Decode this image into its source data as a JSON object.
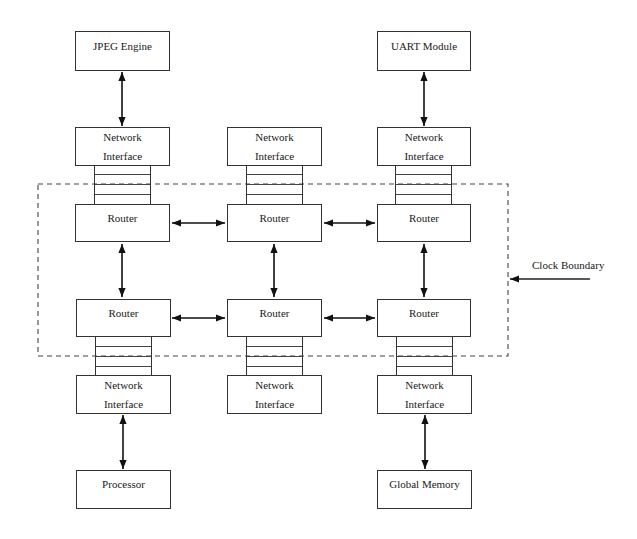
{
  "diagram": {
    "type": "network-on-chip-architecture",
    "colors": {
      "line": "#333333",
      "background": "#ffffff",
      "text": "#1a1a1a"
    },
    "ip_cores_top": [
      {
        "id": "jpeg",
        "label": "JPEG Engine",
        "column": 0
      },
      {
        "id": "uart",
        "label": "UART Module",
        "column": 2
      }
    ],
    "ip_cores_bottom": [
      {
        "id": "processor",
        "label": "Processor",
        "column": 0
      },
      {
        "id": "global_memory",
        "label": "Global Memory",
        "column": 2
      }
    ],
    "network_interfaces_top": [
      {
        "line1": "Network",
        "line2": "Interface"
      },
      {
        "line1": "Network",
        "line2": "Interface"
      },
      {
        "line1": "Network",
        "line2": "Interface"
      }
    ],
    "network_interfaces_bottom": [
      {
        "line1": "Network",
        "line2": "Interface"
      },
      {
        "line1": "Network",
        "line2": "Interface"
      },
      {
        "line1": "Network",
        "line2": "Interface"
      }
    ],
    "routers": [
      [
        "Router",
        "Router",
        "Router"
      ],
      [
        "Router",
        "Router",
        "Router"
      ]
    ],
    "fifo_slots": 4,
    "clock_boundary": {
      "label": "Clock Boundary",
      "style": "dashed"
    },
    "connections": [
      "JPEG Engine <-> Network Interface (top, col 1)",
      "UART Module <-> Network Interface (top, col 3)",
      "Router row1 col1 <-> Router row1 col2",
      "Router row1 col2 <-> Router row1 col3",
      "Router row2 col1 <-> Router row2 col2",
      "Router row2 col2 <-> Router row2 col3",
      "Router row1 col1 <-> Router row2 col1",
      "Router row1 col2 <-> Router row2 col2",
      "Router row1 col3 <-> Router row2 col3",
      "Network Interface (bottom, col 1) <-> Processor",
      "Network Interface (bottom, col 3) <-> Global Memory"
    ]
  }
}
